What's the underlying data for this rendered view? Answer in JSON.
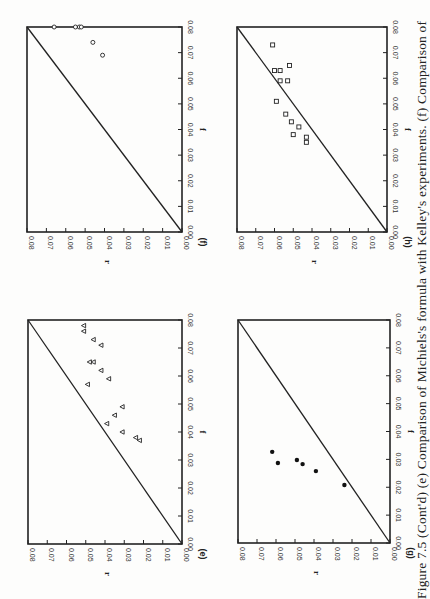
{
  "figure": {
    "caption": "Figure 7.5 (Cont'd) (e) Comparison of Michiels's formula with Kelley's experiments. (f) Comparison of",
    "rotation": "90deg (page scanned sideways)"
  },
  "colors": {
    "ink": "#222222",
    "paper": "#fdfdfc"
  },
  "chart_data": [
    {
      "panel": "(e)",
      "type": "scatter",
      "title": "",
      "xlabel": "f",
      "ylabel": "r",
      "xlim": [
        0,
        0.08
      ],
      "ylim": [
        0,
        0.08
      ],
      "xticks": [
        "0.00",
        "0.01",
        "0.02",
        "0.03",
        "0.04",
        "0.05",
        "0.06",
        "0.07",
        "0.08"
      ],
      "yticks": [
        "0.00",
        "0.01",
        "0.02",
        "0.03",
        "0.04",
        "0.05",
        "0.06",
        "0.07",
        "0.08"
      ],
      "reference_line": "r = f",
      "marker": "triangle-open",
      "series": [
        {
          "name": "data (e)",
          "points": [
            [
              0.078,
              0.051
            ],
            [
              0.076,
              0.051
            ],
            [
              0.073,
              0.046
            ],
            [
              0.071,
              0.042
            ],
            [
              0.065,
              0.048
            ],
            [
              0.065,
              0.046
            ],
            [
              0.062,
              0.042
            ],
            [
              0.059,
              0.038
            ],
            [
              0.057,
              0.049
            ],
            [
              0.049,
              0.031
            ],
            [
              0.046,
              0.035
            ],
            [
              0.043,
              0.039
            ],
            [
              0.04,
              0.031
            ],
            [
              0.038,
              0.024
            ],
            [
              0.037,
              0.022
            ]
          ]
        }
      ]
    },
    {
      "panel": "(f)",
      "type": "scatter",
      "title": "",
      "xlabel": "f",
      "ylabel": "r",
      "xlim": [
        0,
        0.08
      ],
      "ylim": [
        0,
        0.08
      ],
      "xticks": [
        "0.00",
        "0.01",
        "0.02",
        "0.03",
        "0.04",
        "0.05",
        "0.06",
        "0.07",
        "0.08"
      ],
      "yticks": [
        "0.00",
        "0.01",
        "0.02",
        "0.03",
        "0.04",
        "0.05",
        "0.06",
        "0.07",
        "0.08"
      ],
      "reference_line": "r = f",
      "marker": "circle-open",
      "series": [
        {
          "name": "data (f)",
          "points": [
            [
              0.08,
              0.066
            ],
            [
              0.08,
              0.055
            ],
            [
              0.08,
              0.053
            ],
            [
              0.08,
              0.052
            ],
            [
              0.074,
              0.046
            ],
            [
              0.069,
              0.041
            ]
          ]
        }
      ]
    },
    {
      "panel": "(g)",
      "type": "scatter",
      "title": "",
      "xlabel": "f",
      "ylabel": "r",
      "xlim": [
        0,
        0.08
      ],
      "ylim": [
        0,
        0.08
      ],
      "xticks": [
        "0.00",
        "0.01",
        "0.02",
        "0.03",
        "0.04",
        "0.05",
        "0.06",
        "0.07",
        "0.08"
      ],
      "yticks": [
        "0.00",
        "0.01",
        "0.02",
        "0.03",
        "0.04",
        "0.05",
        "0.06",
        "0.07",
        "0.08"
      ],
      "reference_line": "r = f",
      "marker": "circle-filled",
      "series": [
        {
          "name": "data (g)",
          "points": [
            [
              0.0327,
              0.062
            ],
            [
              0.0287,
              0.059
            ],
            [
              0.0298,
              0.049
            ],
            [
              0.0283,
              0.046
            ],
            [
              0.0258,
              0.039
            ],
            [
              0.0208,
              0.024
            ]
          ]
        }
      ]
    },
    {
      "panel": "(h)",
      "type": "scatter",
      "title": "",
      "xlabel": "f",
      "ylabel": "r",
      "xlim": [
        0,
        0.08
      ],
      "ylim": [
        0,
        0.08
      ],
      "xticks": [
        "0.00",
        "0.01",
        "0.02",
        "0.03",
        "0.04",
        "0.05",
        "0.06",
        "0.07",
        "0.08"
      ],
      "yticks": [
        "0.00",
        "0.01",
        "0.02",
        "0.03",
        "0.04",
        "0.05",
        "0.06",
        "0.07",
        "0.08"
      ],
      "reference_line": "r = f",
      "marker": "square-open",
      "series": [
        {
          "name": "data (h)",
          "points": [
            [
              0.073,
              0.061
            ],
            [
              0.063,
              0.06
            ],
            [
              0.063,
              0.057
            ],
            [
              0.065,
              0.052
            ],
            [
              0.059,
              0.057
            ],
            [
              0.059,
              0.053
            ],
            [
              0.051,
              0.059
            ],
            [
              0.046,
              0.054
            ],
            [
              0.043,
              0.051
            ],
            [
              0.041,
              0.047
            ],
            [
              0.038,
              0.05
            ],
            [
              0.037,
              0.043
            ],
            [
              0.035,
              0.043
            ]
          ]
        }
      ]
    }
  ],
  "layout": {
    "panels": [
      {
        "idx": 0,
        "left": 28,
        "right": 182,
        "top": 320,
        "bottom": 544
      },
      {
        "idx": 1,
        "left": 27,
        "right": 182,
        "top": 27,
        "bottom": 232
      },
      {
        "idx": 2,
        "left": 238,
        "right": 390,
        "top": 320,
        "bottom": 543
      },
      {
        "idx": 3,
        "left": 237,
        "right": 387,
        "top": 27,
        "bottom": 232
      }
    ]
  }
}
